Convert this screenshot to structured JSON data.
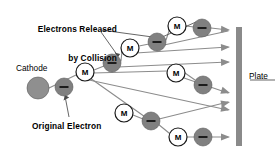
{
  "figure": {
    "kind": "townsend-avalanche-diagram",
    "background_color": "#ffffff",
    "width": 280,
    "height": 158
  },
  "labels": {
    "title_line1": "Electrons Released",
    "title_line2": "by Collision",
    "cathode": "Cathode",
    "original_electron": "Original Electron",
    "plate": "Plate"
  },
  "icon_names": {
    "molecule": "molecule-circle-icon",
    "electron": "electron-disc-icon",
    "cathode": "cathode-disc-icon",
    "plate": "plate-bar-icon",
    "arrow": "arrow-head-icon",
    "leader": "leader-line-icon"
  },
  "colors": {
    "ink": "#000000",
    "electron_fill": "#808080",
    "electron_stroke": "#5a5a5a",
    "cathode_fill": "#8f8f8f",
    "molecule_fill": "#ffffff",
    "molecule_stroke": "#1a1a1a",
    "track": "#8c8c8c",
    "plate": "#8a8a8a",
    "leader": "#4a4a4a"
  },
  "marker_text": {
    "molecule_letter": "M",
    "electron_sign": "−"
  },
  "geometry": {
    "plate": {
      "x": 236,
      "y": 27,
      "width": 6,
      "height": 119
    },
    "cathode": {
      "cx": 38,
      "cy": 88,
      "r": 11
    },
    "molecules": [
      {
        "id": "m1",
        "cx": 85,
        "cy": 72,
        "r": 9
      },
      {
        "id": "m2",
        "cx": 130,
        "cy": 48,
        "r": 9
      },
      {
        "id": "m3",
        "cx": 177,
        "cy": 26,
        "r": 9
      },
      {
        "id": "m4",
        "cx": 176,
        "cy": 73,
        "r": 9
      },
      {
        "id": "m5",
        "cx": 124,
        "cy": 113,
        "r": 9
      },
      {
        "id": "m6",
        "cx": 178,
        "cy": 137,
        "r": 9
      }
    ],
    "electrons": [
      {
        "id": "e0",
        "cx": 64,
        "cy": 87,
        "r": 9,
        "label": "original"
      },
      {
        "id": "e1",
        "cx": 112,
        "cy": 63,
        "r": 9,
        "label": "released"
      },
      {
        "id": "e2",
        "cx": 157,
        "cy": 42,
        "r": 9,
        "label": "released"
      },
      {
        "id": "e3",
        "cx": 202,
        "cy": 28,
        "r": 9,
        "label": "released"
      },
      {
        "id": "e4",
        "cx": 203,
        "cy": 85,
        "r": 9,
        "label": "released"
      },
      {
        "id": "e5",
        "cx": 151,
        "cy": 121,
        "r": 9,
        "label": "released"
      },
      {
        "id": "e6",
        "cx": 203,
        "cy": 137,
        "r": 9,
        "label": "released"
      }
    ],
    "tracks": [
      {
        "from": [
          49,
          88
        ],
        "to": [
          76,
          75
        ]
      },
      {
        "from": [
          94,
          70
        ],
        "to": [
          104,
          66
        ]
      },
      {
        "from": [
          90,
          78
        ],
        "to": [
          148,
          119
        ]
      },
      {
        "from": [
          121,
          61
        ],
        "to": [
          122,
          51
        ]
      },
      {
        "from": [
          118,
          67
        ],
        "to": [
          228,
          62
        ]
      },
      {
        "from": [
          139,
          46
        ],
        "to": [
          149,
          44
        ]
      },
      {
        "from": [
          136,
          53
        ],
        "to": [
          228,
          47
        ]
      },
      {
        "from": [
          166,
          40
        ],
        "to": [
          169,
          31
        ]
      },
      {
        "from": [
          164,
          45
        ],
        "to": [
          228,
          31
        ]
      },
      {
        "from": [
          186,
          26
        ],
        "to": [
          194,
          27
        ]
      },
      {
        "from": [
          211,
          28
        ],
        "to": [
          228,
          30
        ]
      },
      {
        "from": [
          184,
          78
        ],
        "to": [
          228,
          93
        ]
      },
      {
        "from": [
          93,
          73
        ],
        "to": [
          167,
          71
        ]
      },
      {
        "from": [
          185,
          73
        ],
        "to": [
          195,
          80
        ]
      },
      {
        "from": [
          89,
          80
        ],
        "to": [
          228,
          110
        ]
      },
      {
        "from": [
          133,
          115
        ],
        "to": [
          143,
          119
        ]
      },
      {
        "from": [
          159,
          119
        ],
        "to": [
          228,
          102
        ]
      },
      {
        "from": [
          158,
          124
        ],
        "to": [
          169,
          133
        ]
      },
      {
        "from": [
          187,
          137
        ],
        "to": [
          194,
          137
        ]
      },
      {
        "from": [
          212,
          137
        ],
        "to": [
          228,
          137
        ]
      }
    ],
    "arrow_tips": [
      {
        "x": 230,
        "y": 30,
        "angle": 4
      },
      {
        "x": 230,
        "y": 47,
        "angle": -3
      },
      {
        "x": 230,
        "y": 62,
        "angle": -2
      },
      {
        "x": 230,
        "y": 93,
        "angle": 18
      },
      {
        "x": 230,
        "y": 102,
        "angle": -13
      },
      {
        "x": 230,
        "y": 110,
        "angle": 11
      },
      {
        "x": 230,
        "y": 137,
        "angle": 0
      }
    ],
    "leaders": [
      {
        "points": "101,30 160,38 196,22"
      },
      {
        "points": "101,32 118,56"
      },
      {
        "points": "69,117 65,96"
      },
      {
        "points": "275,80 250,80"
      }
    ]
  }
}
